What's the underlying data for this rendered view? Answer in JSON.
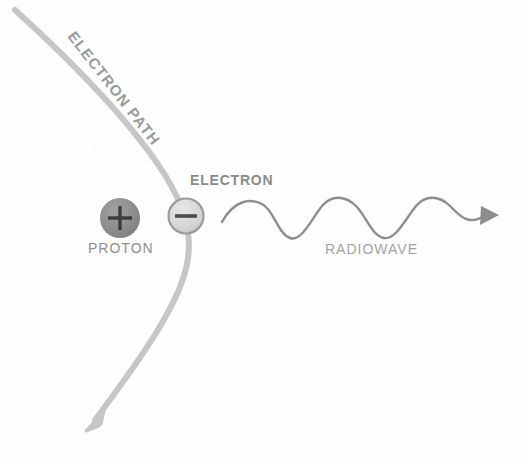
{
  "diagram": {
    "background_color": "#fefefe",
    "labels": {
      "electron_path": "ELECTRON PATH",
      "electron": "ELECTRON",
      "proton": "PROTON",
      "radiowave": "RADIOWAVE"
    },
    "particles": {
      "proton": {
        "name": "PROTON",
        "charge_symbol": "+",
        "fill_color": "#8f8f8f",
        "symbol_color": "#3a3a3a",
        "center_x": 120,
        "center_y": 218,
        "radius": 20
      },
      "electron": {
        "name": "ELECTRON",
        "charge_symbol": "−",
        "fill_color": "#d8d8d8",
        "stroke_color": "#9a9a9a",
        "symbol_color": "#4a4a4a",
        "center_x": 186,
        "center_y": 216,
        "radius": 18
      }
    },
    "paths": {
      "electron_path": {
        "name": "electron-path-curve",
        "color": "#c4c4c4",
        "stroke_width": 6,
        "arrow_direction": "down-left",
        "start": [
          15,
          10
        ],
        "end": [
          88,
          428
        ]
      },
      "radiowave": {
        "name": "radiowave-sine",
        "color": "#8d8d8d",
        "stroke_width": 2.4,
        "arrow_direction": "right",
        "start_x": 222,
        "end_x": 498,
        "baseline_y": 218,
        "amplitude": 17,
        "cycles": 3
      }
    }
  }
}
